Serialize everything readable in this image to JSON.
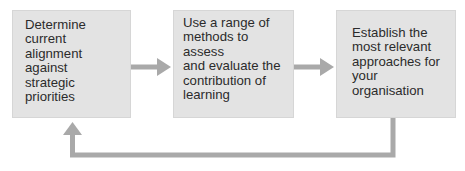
{
  "diagram": {
    "type": "cyclical process flow",
    "steps": [
      {
        "id": 1,
        "label": "Determine current alignment against strategic priorities",
        "lines": [
          "Determine current",
          "alignment against",
          "strategic priorities"
        ]
      },
      {
        "id": 2,
        "label": "Use a range of methods to assess and evaluate the contribution of learning",
        "lines": [
          "Use a range of",
          "methods to assess",
          "and evaluate the",
          "contribution of",
          "learning"
        ]
      },
      {
        "id": 3,
        "label": "Establish the most relevant approaches for your organisation",
        "lines": [
          "Establish the",
          "most relevant",
          "approaches for",
          "your organisation"
        ]
      }
    ],
    "connections": [
      {
        "from": 1,
        "to": 2,
        "style": "straight arrow"
      },
      {
        "from": 2,
        "to": 3,
        "style": "straight arrow"
      },
      {
        "from": 3,
        "to": 1,
        "style": "feedback loop below boxes"
      }
    ],
    "colors": {
      "box_fill": "#e3e3e3",
      "box_border": "#d6d6d6",
      "arrow": "#a9a9a9",
      "text": "#2b2b2b"
    }
  }
}
